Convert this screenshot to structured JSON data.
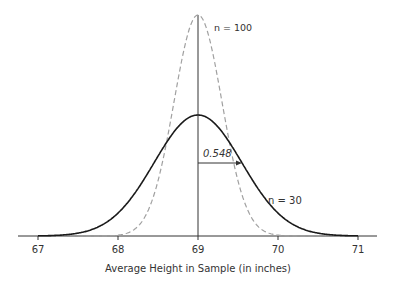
{
  "chart_data": {
    "type": "line",
    "title": "",
    "xlabel": "Average Height in Sample (in inches)",
    "ylabel": "",
    "xlim": [
      66.8,
      71.25
    ],
    "x_ticks": [
      67,
      68,
      69,
      70,
      71
    ],
    "x_tick_labels": [
      "67",
      "68",
      "69",
      "70",
      "71"
    ],
    "grid": false,
    "legend": "none",
    "series": [
      {
        "name": "n = 30",
        "distribution": "normal",
        "mean": 69,
        "sd": 0.548,
        "style": "solid",
        "color": "#222222"
      },
      {
        "name": "n = 100",
        "distribution": "normal",
        "mean": 69,
        "sd": 0.3,
        "style": "dashed",
        "color": "#999999"
      }
    ],
    "annotations": [
      {
        "text": "n = 100",
        "target": "dashed curve"
      },
      {
        "text": "n = 30",
        "target": "solid curve"
      },
      {
        "text": "0.548",
        "type": "arrow",
        "from": 69,
        "to": 69.548
      }
    ]
  },
  "labels": {
    "n100": "n = 100",
    "n30": "n = 30",
    "sd": "0.548",
    "xlabel": "Average Height in Sample (in inches)",
    "ticks": [
      "67",
      "68",
      "69",
      "70",
      "71"
    ]
  }
}
